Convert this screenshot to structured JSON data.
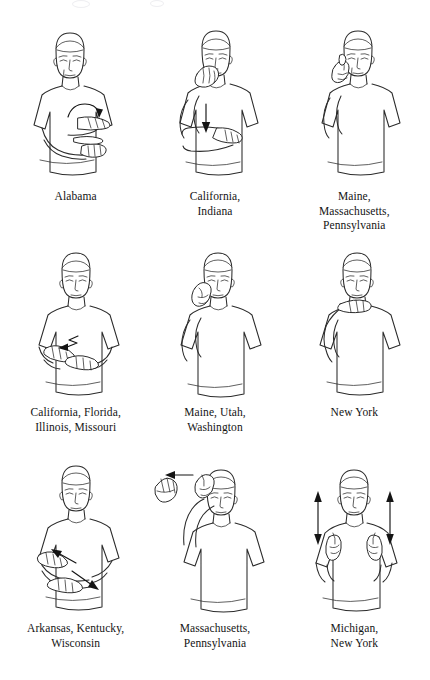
{
  "page": {
    "kind": "illustration-plate",
    "background_color": "#ffffff",
    "ink_color": "#2b2b2b",
    "columns": 3,
    "rows": 3
  },
  "figures": [
    {
      "id": "sign-1",
      "position": "row1-col1",
      "icon": "asl-sign-figure",
      "pose": "crossed-forearms-with-curved-arrow",
      "arrow": "curved-arrow-down-over-forearm",
      "caption_lines": [
        "Alabama"
      ]
    },
    {
      "id": "sign-2",
      "position": "row1-col2",
      "icon": "asl-sign-figure",
      "pose": "flat-hand-at-mouth-other-arm-horizontal",
      "arrow": "straight-arrow-down",
      "caption_lines": [
        "California,",
        "Indiana"
      ]
    },
    {
      "id": "sign-3",
      "position": "row1-col3",
      "icon": "asl-sign-figure",
      "pose": "hand-raised-to-temple",
      "arrow": "none",
      "caption_lines": [
        "Maine,",
        "Massachusetts,",
        "Pennsylvania"
      ]
    },
    {
      "id": "sign-4",
      "position": "row2-col1",
      "icon": "asl-sign-figure",
      "pose": "both-hands-together-at-chest",
      "arrow": "zigzag-arrow-left",
      "caption_lines": [
        "California, Florida,",
        "Illinois, Missouri"
      ]
    },
    {
      "id": "sign-5",
      "position": "row2-col2",
      "icon": "asl-sign-figure",
      "pose": "hand-raised-beside-ear",
      "arrow": "none",
      "caption_lines": [
        "Maine, Utah,",
        "Washington"
      ]
    },
    {
      "id": "sign-6",
      "position": "row2-col3",
      "icon": "asl-sign-figure",
      "pose": "hand-at-throat-under-chin",
      "arrow": "none",
      "caption_lines": [
        "New York"
      ]
    },
    {
      "id": "sign-7",
      "position": "row3-col1",
      "icon": "asl-sign-figure",
      "pose": "crossed-arms-at-chest",
      "arrow": "two-diagonal-arrows-up-left-and-down-right",
      "caption_lines": [
        "Arkansas, Kentucky,",
        "Wisconsin"
      ]
    },
    {
      "id": "sign-8",
      "position": "row3-col2",
      "icon": "asl-sign-figure",
      "pose": "arm-raised-above-head-with-second-hand",
      "arrow": "straight-arrow-left",
      "caption_lines": [
        "Massachusetts,",
        "Pennsylvania"
      ]
    },
    {
      "id": "sign-9",
      "position": "row3-col3",
      "icon": "asl-sign-figure",
      "pose": "both-hands-at-shoulders",
      "arrow": "two-double-headed-vertical-arrows",
      "caption_lines": [
        "Michigan,",
        "New York"
      ]
    }
  ]
}
